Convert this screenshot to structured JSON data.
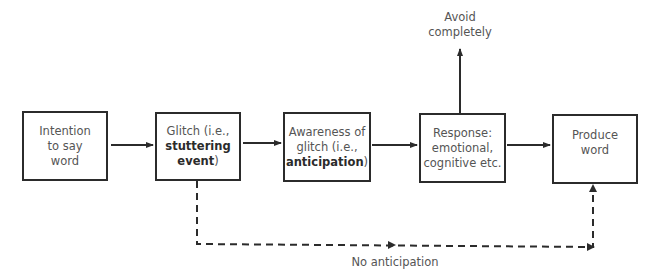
{
  "diagram": {
    "nodes": [
      {
        "id": "intention",
        "lines": [
          "Intention",
          "to say",
          "word"
        ]
      },
      {
        "id": "glitch",
        "line1": "Glitch (i.e.,",
        "bold": "stuttering",
        "bold2": "event",
        "tail": ")"
      },
      {
        "id": "awareness",
        "line1": "Awareness of",
        "line2": "glitch (i.e.,",
        "bold": "anticipation",
        "tail": ")"
      },
      {
        "id": "response",
        "lines": [
          "Response:",
          "emotional,",
          "cognitive etc."
        ]
      },
      {
        "id": "produce",
        "lines": [
          "Produce",
          "word"
        ]
      }
    ],
    "labels": {
      "avoid": [
        "Avoid",
        "completely"
      ],
      "no_anticipation": "No anticipation"
    },
    "edges": [
      {
        "from": "intention",
        "to": "glitch",
        "style": "solid"
      },
      {
        "from": "glitch",
        "to": "awareness",
        "style": "solid"
      },
      {
        "from": "awareness",
        "to": "response",
        "style": "solid"
      },
      {
        "from": "response",
        "to": "produce",
        "style": "solid"
      },
      {
        "from": "response",
        "to": "avoid",
        "style": "solid"
      },
      {
        "from": "glitch",
        "to": "produce",
        "style": "dashed",
        "label": "No anticipation"
      }
    ],
    "colors": {
      "stroke": "#2b2b2b",
      "text": "#555555"
    }
  }
}
